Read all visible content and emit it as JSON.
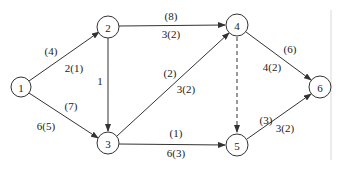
{
  "diagram": {
    "type": "network-flow-graph",
    "nodes": [
      {
        "id": "1",
        "label": "1",
        "x": 21,
        "y": 87
      },
      {
        "id": "2",
        "label": "2",
        "x": 108,
        "y": 27
      },
      {
        "id": "3",
        "label": "3",
        "x": 108,
        "y": 143
      },
      {
        "id": "4",
        "label": "4",
        "x": 237,
        "y": 25
      },
      {
        "id": "5",
        "label": "5",
        "x": 237,
        "y": 145
      },
      {
        "id": "6",
        "label": "6",
        "x": 320,
        "y": 87
      }
    ],
    "edges": [
      {
        "from": "1",
        "to": "2",
        "capacity": "(4)",
        "flow": "2(1)",
        "style": "solid"
      },
      {
        "from": "1",
        "to": "3",
        "capacity": "(7)",
        "flow": "6(5)",
        "style": "solid"
      },
      {
        "from": "2",
        "to": "4",
        "capacity": "(8)",
        "flow": "3(2)",
        "style": "solid"
      },
      {
        "from": "2",
        "to": "3",
        "capacity": "",
        "flow": "1",
        "style": "solid"
      },
      {
        "from": "3",
        "to": "4",
        "capacity": "(2)",
        "flow": "3(2)",
        "style": "solid"
      },
      {
        "from": "3",
        "to": "5",
        "capacity": "(1)",
        "flow": "6(3)",
        "style": "solid"
      },
      {
        "from": "4",
        "to": "5",
        "capacity": "",
        "flow": "",
        "style": "dashed"
      },
      {
        "from": "4",
        "to": "6",
        "capacity": "(6)",
        "flow": "4(2)",
        "style": "solid"
      },
      {
        "from": "5",
        "to": "6",
        "capacity": "(3)",
        "flow": "3(2)",
        "style": "solid"
      }
    ]
  },
  "labels": {
    "n1": "1",
    "n2": "2",
    "n3": "3",
    "n4": "4",
    "n5": "5",
    "n6": "6",
    "e12_top": "(4)",
    "e12_bot": "2(1)",
    "e13_top": "(7)",
    "e13_bot": "6(5)",
    "e24_top": "(8)",
    "e24_bot": "3(2)",
    "e23": "1",
    "e34_top": "(2)",
    "e34_bot": "3(2)",
    "e35_top": "(1)",
    "e35_bot": "6(3)",
    "e46_top": "(6)",
    "e46_bot": "4(2)",
    "e56_top": "(3)",
    "e56_bot": "3(2)"
  }
}
